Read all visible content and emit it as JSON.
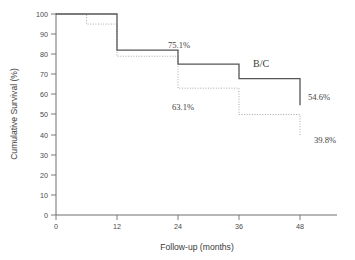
{
  "chart_data": {
    "type": "line",
    "title": "",
    "subtitle": "",
    "xlabel": "Follow-up (months)",
    "ylabel": "Cumulative Survival (%)",
    "xlim": [
      0,
      54
    ],
    "ylim": [
      0,
      100
    ],
    "grid": false,
    "legend_position": "inline-annotation",
    "xticks": [
      0,
      12,
      24,
      36,
      48
    ],
    "xtick_labels": [
      "0",
      "12",
      "24",
      "36",
      "48"
    ],
    "yticks": [
      0,
      10,
      20,
      30,
      40,
      50,
      60,
      70,
      80,
      90,
      100
    ],
    "ytick_labels": [
      "0",
      "10",
      "20",
      "30",
      "40",
      "50",
      "60",
      "70",
      "80",
      "90",
      "100"
    ],
    "series": [
      {
        "name": "B/C",
        "style": "solid",
        "color": "#555555",
        "step": "post",
        "x": [
          0,
          6,
          12,
          24,
          36,
          48
        ],
        "values": [
          100,
          100,
          82,
          75.1,
          67.8,
          54.6
        ]
      },
      {
        "name": "other",
        "style": "dotted",
        "color": "#a8a8a8",
        "step": "post",
        "x": [
          0,
          6,
          12,
          24,
          36,
          48
        ],
        "values": [
          100,
          95,
          79,
          63.1,
          50,
          39.8
        ]
      }
    ],
    "annotations": [
      {
        "text": "75.1%",
        "x": 24,
        "y": 75.1,
        "series": "B/C"
      },
      {
        "text": "63.1%",
        "x": 24,
        "y": 63.1,
        "series": "other"
      },
      {
        "text": "54.6%",
        "x": 48,
        "y": 54.6,
        "series": "B/C"
      },
      {
        "text": "39.8%",
        "x": 48,
        "y": 39.8,
        "series": "other"
      },
      {
        "text": "B/C",
        "x": 38,
        "y": 78,
        "series": "B/C"
      }
    ]
  },
  "axes": {
    "x_title": "Follow-up (months)",
    "y_title": "Cumulative Survival (%)",
    "x_ticks": [
      {
        "label": "0",
        "px": 56
      },
      {
        "label": "12",
        "px": 117
      },
      {
        "label": "24",
        "px": 178
      },
      {
        "label": "36",
        "px": 239
      },
      {
        "label": "48",
        "px": 300
      }
    ],
    "y_ticks": [
      {
        "label": "100",
        "px": 14
      },
      {
        "label": "90",
        "px": 34
      },
      {
        "label": "80",
        "px": 54
      },
      {
        "label": "70",
        "px": 74
      },
      {
        "label": "60",
        "px": 94
      },
      {
        "label": "50",
        "px": 114
      },
      {
        "label": "40",
        "px": 135
      },
      {
        "label": "30",
        "px": 155
      },
      {
        "label": "20",
        "px": 175
      },
      {
        "label": "10",
        "px": 195
      },
      {
        "label": "0",
        "px": 215
      }
    ]
  },
  "labels": {
    "group_bc": "B/C",
    "annot_751": "75.1%",
    "annot_631": "63.1%",
    "annot_546": "54.6%",
    "annot_398": "39.8%"
  },
  "colors": {
    "solid_curve": "#555555",
    "dotted_curve": "#a8a8a8",
    "axis": "#6e6e6e",
    "text": "#3f3f3f",
    "background": "#ffffff"
  }
}
